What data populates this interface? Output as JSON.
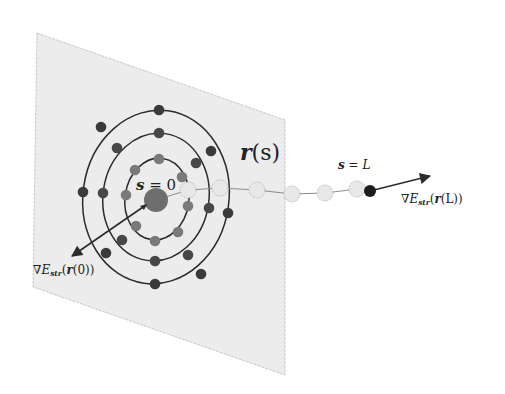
{
  "diagram": {
    "plane": {
      "corners": [
        [
          37,
          33
        ],
        [
          285,
          120
        ],
        [
          285,
          375
        ],
        [
          33,
          287
        ]
      ],
      "fill": "#ececec",
      "stroke": "#bdbdbd"
    },
    "rings": [
      {
        "name": "outer",
        "cx": 156,
        "cy": 197,
        "rx": 73,
        "ry": 87,
        "rotate": 8,
        "dot_color": "#3a3a3a",
        "dots": [
          [
            159,
            110
          ],
          [
            101,
            127
          ],
          [
            211,
            151
          ],
          [
            83,
            192
          ],
          [
            228,
            213
          ],
          [
            106,
            253
          ],
          [
            155,
            284
          ],
          [
            201,
            274
          ]
        ]
      },
      {
        "name": "middle",
        "cx": 156,
        "cy": 197,
        "rx": 53,
        "ry": 64,
        "rotate": 8,
        "dot_color": "#474747",
        "dots": [
          [
            159,
            133
          ],
          [
            117,
            148
          ],
          [
            196,
            163
          ],
          [
            103,
            193
          ],
          [
            209,
            208
          ],
          [
            122,
            240
          ],
          [
            155,
            261
          ],
          [
            188,
            255
          ]
        ]
      },
      {
        "name": "inner",
        "cx": 157,
        "cy": 199,
        "rx": 32,
        "ry": 41,
        "rotate": 8,
        "dot_color": "#7a7a7a",
        "dots": [
          [
            159,
            159
          ],
          [
            135,
            170
          ],
          [
            182,
            177
          ],
          [
            126,
            195
          ],
          [
            188,
            206
          ],
          [
            136,
            226
          ],
          [
            155,
            241
          ],
          [
            178,
            232
          ]
        ]
      }
    ],
    "center_dot": {
      "x": 156,
      "y": 200,
      "r": 12,
      "color": "#6e6e6e"
    },
    "chain_beads": [
      [
        188,
        190
      ],
      [
        220,
        188
      ],
      [
        257,
        190
      ],
      [
        292,
        194
      ],
      [
        325,
        193
      ],
      [
        357,
        189
      ]
    ],
    "chain_bead_color": "#e8e8e8",
    "end_dot": {
      "x": 370,
      "y": 191,
      "r": 6,
      "color": "#1c1c1c"
    },
    "arrow_start": {
      "from": [
        146,
        205
      ],
      "to": [
        72,
        256
      ]
    },
    "arrow_end": {
      "from": [
        370,
        191
      ],
      "to": [
        430,
        176
      ]
    },
    "line_color": "#2b2b2b"
  },
  "labels": {
    "s0": {
      "lhs": "s",
      "eq": " = ",
      "rhs": "0"
    },
    "rs": {
      "r": "r",
      "paren_open": "(",
      "s": "s",
      "paren_close": ")"
    },
    "sL": {
      "lhs": "s",
      "eq": " = ",
      "rhs": "L"
    },
    "grad_start": {
      "nabla": "∇",
      "E": "E",
      "sub": "str",
      "open": "(",
      "r": "r",
      "arg": "(0)",
      "close": ")"
    },
    "grad_end": {
      "nabla": "∇",
      "E": "E",
      "sub": "str",
      "open": "(",
      "r": "r",
      "arg": "(L)",
      "close": ")"
    }
  }
}
